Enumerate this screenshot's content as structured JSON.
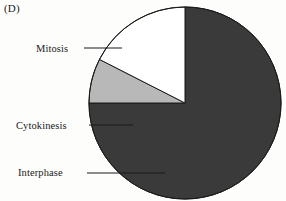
{
  "panel": {
    "marker": "(D)"
  },
  "labels": {
    "mitosis": "Mitosis",
    "cytokinesis": "Cytokinesis",
    "interphase": "Interphase"
  },
  "colors": {
    "mitosis": "#3a3a3a",
    "cytokinesis": "#b8b8b8",
    "interphase": "#ffffff",
    "outline": "#1a1a1a",
    "leader": "#1a1a1a",
    "background": "#fdfdfb"
  },
  "chart_data": {
    "type": "pie",
    "title": "(D)",
    "labels": [
      "Mitosis",
      "Cytokinesis",
      "Interphase"
    ],
    "values": [
      75,
      7.5,
      17.5
    ],
    "units": "percent",
    "colors": [
      "#3a3a3a",
      "#b8b8b8",
      "#ffffff"
    ],
    "start_angle_deg": 270,
    "direction": "clockwise",
    "slice_angles_deg": [
      270,
      27.5,
      62.5
    ],
    "legend": "none",
    "grid": false,
    "annotations": [
      {
        "text": "Mitosis",
        "target_slice": "Mitosis",
        "leader": true
      },
      {
        "text": "Cytokinesis",
        "target_slice": "Cytokinesis",
        "leader": true
      },
      {
        "text": "Interphase",
        "target_slice": "Interphase",
        "leader": true
      }
    ],
    "geometry": {
      "cx": 185,
      "cy": 103,
      "r": 96
    }
  }
}
